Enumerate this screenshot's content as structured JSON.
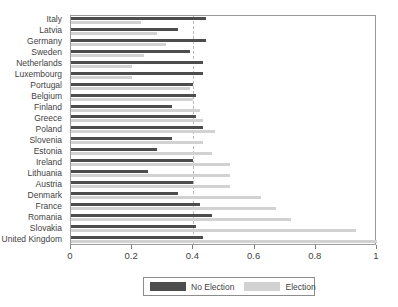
{
  "chart_data": {
    "type": "bar",
    "orientation": "horizontal",
    "title": "",
    "xlabel": "",
    "ylabel": "",
    "xlim": [
      0,
      1
    ],
    "xticks": [
      0,
      0.2,
      0.4,
      0.6,
      0.8,
      1
    ],
    "xticklabels": [
      "0",
      "0.2",
      "0.4",
      "0.6",
      "0.8",
      "1"
    ],
    "grid": false,
    "reference_line": 0.4,
    "legend_position": "bottom",
    "colors": {
      "no_election": "#4d4d4d",
      "election": "#d2d2d2",
      "axis": "#7c7c7c",
      "frame": "#9a9a9a",
      "reference_line": "#b9b9b9"
    },
    "categories": [
      "Italy",
      "Latvia",
      "Germany",
      "Sweden",
      "Netherlands",
      "Luxembourg",
      "Portugal",
      "Belgium",
      "Finland",
      "Greece",
      "Poland",
      "Slovenia",
      "Estonia",
      "Ireland",
      "Lithuania",
      "Austria",
      "Denmark",
      "France",
      "Romania",
      "Slovakia",
      "United Kingdom"
    ],
    "series": [
      {
        "name": "No Election",
        "color": "#4d4d4d",
        "values": [
          0.44,
          0.35,
          0.44,
          0.39,
          0.43,
          0.43,
          0.4,
          0.41,
          0.33,
          0.41,
          0.43,
          0.33,
          0.28,
          0.4,
          0.25,
          0.4,
          0.35,
          0.42,
          0.46,
          0.41,
          0.43
        ]
      },
      {
        "name": "Election",
        "color": "#d2d2d2",
        "values": [
          0.23,
          0.28,
          0.31,
          0.24,
          0.2,
          0.2,
          0.39,
          0.4,
          0.42,
          0.43,
          0.47,
          0.43,
          0.46,
          0.52,
          0.52,
          0.52,
          0.62,
          0.67,
          0.72,
          0.93,
          1.0
        ]
      }
    ],
    "legend": [
      {
        "label": "No Election",
        "color": "#4d4d4d"
      },
      {
        "label": "Election",
        "color": "#d2d2d2"
      }
    ]
  }
}
